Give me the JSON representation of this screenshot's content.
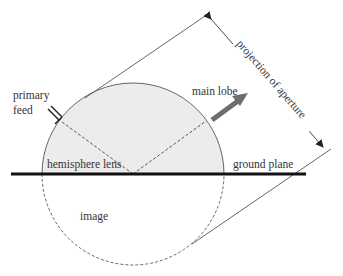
{
  "diagram": {
    "labels": {
      "primary_feed_line1": "primary",
      "primary_feed_line2": "feed",
      "main_lobe": "main lobe",
      "projection": "projection of aperture",
      "hemisphere_lens": "hemisphere lens",
      "ground_plane": "ground plane",
      "image": "image"
    },
    "colors": {
      "lens_fill": "#ececec",
      "stroke": "#555555",
      "ground": "#111111",
      "arrow": "#6e6e6e"
    }
  }
}
